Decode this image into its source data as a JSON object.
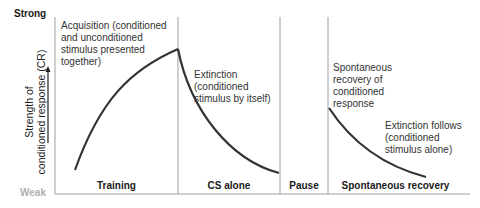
{
  "axis": {
    "y_top_label": "Strong",
    "y_bottom_label": "Weak",
    "y_title_line1": "Strength of",
    "y_title_line2": "conditioned response (CR)"
  },
  "phases": [
    {
      "label": "Training"
    },
    {
      "label": "CS alone"
    },
    {
      "label": "Pause"
    },
    {
      "label": "Spontaneous recovery"
    }
  ],
  "annotations": {
    "acquisition": [
      "Acquisition (conditioned",
      "and unconditioned",
      "stimulus presented",
      "together)"
    ],
    "extinction": [
      "Extinction",
      "(conditioned",
      "stimulus by itself)"
    ],
    "spontaneous": [
      "Spontaneous",
      "recovery of",
      "conditioned",
      "response"
    ],
    "extinction_follows": [
      "Extinction follows",
      "(conditioned",
      "stimulus alone)"
    ]
  },
  "colors": {
    "curve": "#333333",
    "divider": "#a0a0a0",
    "weak": "#b0b0b0"
  }
}
